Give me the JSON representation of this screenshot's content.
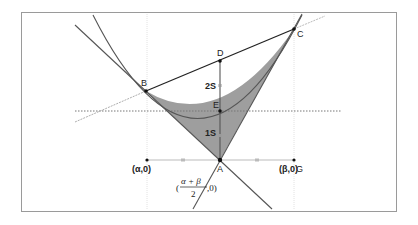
{
  "diagram": {
    "type": "parabola-area-geometry",
    "colors": {
      "frame": "#9a9a9a",
      "curve": "#555555",
      "shade": "#9e9e9e",
      "chord": "#222222",
      "guide": "#c8c8c8",
      "dashed": "#888888"
    },
    "points": {
      "A": {
        "label": "A"
      },
      "B": {
        "label": "B"
      },
      "C": {
        "label": "C"
      },
      "D": {
        "label": "D"
      },
      "E": {
        "label": "E"
      },
      "G": {
        "label": "G"
      }
    },
    "labels": {
      "alpha_point": "(α,0)",
      "beta_point": "(β,0)",
      "midpoint_numerator": "α + β",
      "midpoint_denominator": "2",
      "midpoint_open": "(",
      "midpoint_close": ",0)",
      "segment_upper": "2S",
      "segment_lower": "1S"
    }
  }
}
